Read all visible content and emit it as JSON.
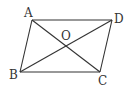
{
  "figure": {
    "type": "parallelogram-with-diagonals",
    "stroke_color": "#333333",
    "background": "#ffffff"
  },
  "points": {
    "A": {
      "label": "A",
      "x": 32,
      "y": 20
    },
    "D": {
      "label": "D",
      "x": 112,
      "y": 20
    },
    "B": {
      "label": "B",
      "x": 20,
      "y": 72
    },
    "C": {
      "label": "C",
      "x": 100,
      "y": 72
    },
    "O": {
      "label": "O",
      "x": 66,
      "y": 46
    }
  },
  "segments": [
    "AD",
    "BC",
    "AB",
    "DC",
    "AC",
    "BD"
  ]
}
